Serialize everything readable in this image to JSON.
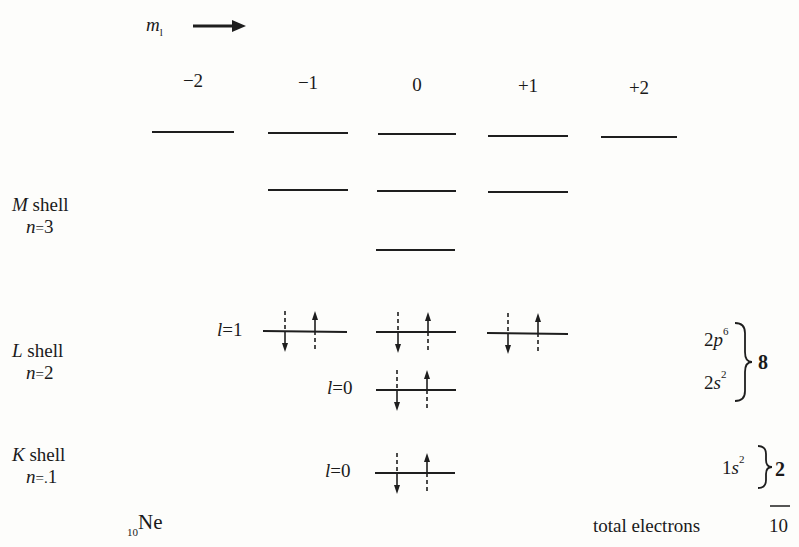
{
  "axis": {
    "label_main": "m",
    "label_sub": "l",
    "arrow": "right-arrow"
  },
  "ml_values": [
    {
      "label": "−2",
      "x": 193
    },
    {
      "label": "−1",
      "x": 308
    },
    {
      "label": "0",
      "x": 417
    },
    {
      "label": "+1",
      "x": 528
    },
    {
      "label": "+2",
      "x": 639
    }
  ],
  "shells": [
    {
      "id": "M",
      "name": "M",
      "word": "shell",
      "n_label": "n",
      "n_value": "3",
      "n_text": "n = 3"
    },
    {
      "id": "L",
      "name": "L",
      "word": "shell",
      "n_label": "n",
      "n_value": "2",
      "n_text": "n = 2"
    },
    {
      "id": "K",
      "name": "K",
      "word": "shell",
      "n_label": "n",
      "n_value": "1",
      "n_text": "n =.1"
    }
  ],
  "sublevels": {
    "L_l1": {
      "label_l": "l",
      "label_eq": "=1"
    },
    "L_l0": {
      "label_l": "l",
      "label_eq": "=0"
    },
    "K_l0": {
      "label_l": "l",
      "label_eq": "=0"
    }
  },
  "configs": {
    "L_p": {
      "base": "2p",
      "sup": "6"
    },
    "L_s": {
      "base": "2s",
      "sup": "2"
    },
    "L_total": "8",
    "K_s": {
      "base": "1s",
      "sup": "2"
    },
    "K_total": "2"
  },
  "element": {
    "atomic_number": "10",
    "symbol": "Ne"
  },
  "footer": {
    "total_label": "total electrons",
    "total_value": "10"
  },
  "colors": {
    "ink": "#1e1e1e",
    "paper": "#fdfdfb"
  }
}
